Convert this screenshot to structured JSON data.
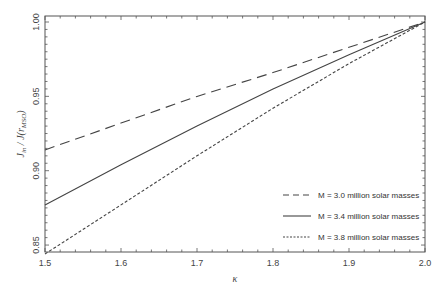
{
  "chart_data": {
    "type": "line",
    "title": "",
    "xlabel": "κ",
    "ylabel": "J_in / J(r_MSO)",
    "xlim": [
      1.5,
      2.0
    ],
    "ylim": [
      0.84,
      1.005
    ],
    "xticks": [
      "1.5",
      "1.6",
      "1.7",
      "1.8",
      "1.9",
      "2.0"
    ],
    "yticks": [
      "0.85",
      "0.90",
      "0.95",
      "1.00"
    ],
    "grid": false,
    "legend_position": "lower right",
    "x": [
      1.5,
      1.6,
      1.7,
      1.8,
      1.9,
      2.0
    ],
    "series": [
      {
        "name": "M = 3.0 million solar masses",
        "style": "dashed",
        "values": [
          0.914,
          0.932,
          0.95,
          0.966,
          0.983,
          1.0
        ]
      },
      {
        "name": "M = 3.4 million solar masses",
        "style": "solid",
        "values": [
          0.877,
          0.904,
          0.93,
          0.955,
          0.978,
          1.0
        ]
      },
      {
        "name": "M = 3.8 million solar masses",
        "style": "dotted",
        "values": [
          0.844,
          0.877,
          0.91,
          0.942,
          0.972,
          1.0
        ]
      }
    ]
  },
  "labels": {
    "xlabel": "κ",
    "ylabel_main": "J",
    "ylabel_sub": "in",
    "ylabel_rest": " / J(r",
    "ylabel_sub2": "MSO",
    "ylabel_close": ")",
    "legend": [
      "M = 3.0 million solar masses",
      "M = 3.4 million solar masses",
      "M = 3.8 million solar masses"
    ]
  }
}
